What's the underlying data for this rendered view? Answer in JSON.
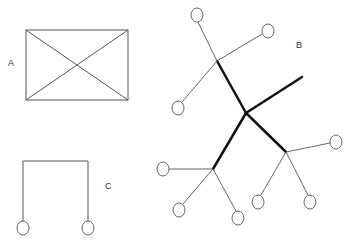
{
  "labels": {
    "a": "A",
    "b": "B",
    "c": "C"
  },
  "colors": {
    "stroke": "#555555",
    "thick": "#111111",
    "background": "#ffffff"
  },
  "figures": {
    "a": {
      "type": "rectangle-with-diagonals",
      "x": 26,
      "y": 30,
      "width": 102,
      "height": 70
    },
    "b": {
      "type": "tree",
      "center": [
        246,
        113
      ],
      "junctions": [
        [
          217,
          61
        ],
        [
          213,
          169
        ],
        [
          286,
          152
        ]
      ],
      "free_end": [
        302,
        77
      ],
      "leaf_nodes": [
        [
          197,
          15
        ],
        [
          268,
          31
        ],
        [
          178,
          108
        ],
        [
          163,
          169
        ],
        [
          179,
          210
        ],
        [
          238,
          218
        ],
        [
          258,
          202
        ],
        [
          310,
          202
        ],
        [
          336,
          142
        ]
      ]
    },
    "c": {
      "type": "bracket-with-two-nodes",
      "left_x": 23,
      "right_x": 88,
      "top_y": 161,
      "node_y": 228
    }
  }
}
